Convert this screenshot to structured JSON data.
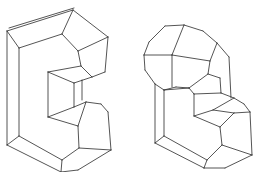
{
  "figure": {
    "stroke_color": "#2a2a2a",
    "background": "#ffffff",
    "shapes": [
      {
        "name": "c-shaped-polyhedron",
        "lines": [
          [
            7,
            31,
            73,
            10
          ],
          [
            9,
            28,
            74,
            8
          ],
          [
            7,
            31,
            19,
            48
          ],
          [
            19,
            48,
            62,
            34
          ],
          [
            62,
            34,
            73,
            10
          ],
          [
            73,
            10,
            108,
            37
          ],
          [
            62,
            34,
            78,
            51
          ],
          [
            78,
            51,
            108,
            37
          ],
          [
            108,
            37,
            105,
            72
          ],
          [
            78,
            51,
            81,
            66
          ],
          [
            81,
            66,
            92,
            77
          ],
          [
            92,
            77,
            105,
            72
          ],
          [
            7,
            31,
            7,
            145
          ],
          [
            19,
            48,
            19,
            136
          ],
          [
            81,
            66,
            48,
            72
          ],
          [
            48,
            72,
            48,
            117
          ],
          [
            48,
            72,
            74,
            83
          ],
          [
            74,
            83,
            92,
            77
          ],
          [
            74,
            83,
            74,
            107
          ],
          [
            82,
            80,
            82,
            100
          ],
          [
            74,
            107,
            48,
            117
          ],
          [
            74,
            107,
            86,
            102
          ],
          [
            86,
            102,
            101,
            104
          ],
          [
            101,
            104,
            108,
            112
          ],
          [
            86,
            102,
            78,
            126
          ],
          [
            48,
            117,
            78,
            126
          ],
          [
            108,
            112,
            111,
            150
          ],
          [
            78,
            126,
            79,
            148
          ],
          [
            79,
            148,
            111,
            150
          ],
          [
            19,
            136,
            62,
            160
          ],
          [
            7,
            145,
            61,
            172
          ],
          [
            19,
            136,
            7,
            145
          ],
          [
            62,
            160,
            61,
            172
          ],
          [
            62,
            160,
            79,
            148
          ],
          [
            61,
            172,
            78,
            170
          ],
          [
            78,
            170,
            111,
            150
          ]
        ]
      },
      {
        "name": "domed-l-shaped-polyhedron",
        "lines": [
          [
            165,
            26,
            184,
            25
          ],
          [
            184,
            25,
            203,
            31
          ],
          [
            203,
            31,
            217,
            43
          ],
          [
            217,
            43,
            229,
            57
          ],
          [
            165,
            26,
            149,
            42
          ],
          [
            149,
            42,
            144,
            55
          ],
          [
            144,
            55,
            145,
            70
          ],
          [
            145,
            70,
            155,
            84
          ],
          [
            155,
            84,
            164,
            90
          ],
          [
            164,
            90,
            176,
            87
          ],
          [
            176,
            87,
            189,
            88
          ],
          [
            184,
            25,
            172,
            55
          ],
          [
            144,
            55,
            172,
            55
          ],
          [
            172,
            55,
            210,
            61
          ],
          [
            210,
            61,
            217,
            43
          ],
          [
            172,
            55,
            172,
            87
          ],
          [
            210,
            61,
            208,
            74
          ],
          [
            208,
            74,
            189,
            88
          ],
          [
            229,
            57,
            231,
            98
          ],
          [
            208,
            74,
            220,
            78
          ],
          [
            220,
            78,
            221,
            93
          ],
          [
            189,
            88,
            194,
            94
          ],
          [
            194,
            94,
            221,
            93
          ],
          [
            194,
            94,
            194,
            116
          ],
          [
            221,
            93,
            234,
            98
          ],
          [
            234,
            98,
            244,
            104
          ],
          [
            244,
            104,
            250,
            112
          ],
          [
            194,
            116,
            213,
            110
          ],
          [
            213,
            110,
            234,
            98
          ],
          [
            194,
            116,
            220,
            127
          ],
          [
            220,
            127,
            234,
            113
          ],
          [
            234,
            113,
            250,
            112
          ],
          [
            234,
            113,
            213,
            110
          ],
          [
            155,
            84,
            155,
            143
          ],
          [
            164,
            90,
            164,
            136
          ],
          [
            164,
            90,
            189,
            88
          ],
          [
            250,
            112,
            252,
            155
          ],
          [
            220,
            127,
            222,
            145
          ],
          [
            222,
            145,
            252,
            155
          ],
          [
            164,
            136,
            207,
            160
          ],
          [
            155,
            143,
            204,
            168
          ],
          [
            155,
            143,
            164,
            136
          ],
          [
            207,
            160,
            204,
            168
          ],
          [
            207,
            160,
            222,
            145
          ],
          [
            204,
            168,
            225,
            168
          ],
          [
            225,
            168,
            252,
            155
          ]
        ]
      }
    ]
  }
}
